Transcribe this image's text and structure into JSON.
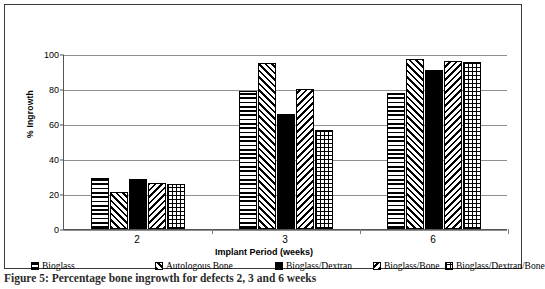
{
  "figure": {
    "caption": "Figure 5: Percentage bone ingrowth for defects 2, 3 and 6 weeks"
  },
  "chart_data": {
    "type": "bar",
    "title": "",
    "xlabel": "Implant Period (weeks)",
    "ylabel": "% Ingrowth",
    "categories": [
      "2",
      "3",
      "6"
    ],
    "ylim": [
      0,
      100
    ],
    "yticks": [
      0,
      20,
      40,
      60,
      80,
      100
    ],
    "grid": true,
    "legend_position": "bottom",
    "series": [
      {
        "name": "Bioglass",
        "pattern": "horizontal-lines",
        "values": [
          29,
          79,
          78
        ]
      },
      {
        "name": "Autologous Bone",
        "pattern": "back-diagonal",
        "values": [
          21,
          95,
          97
        ]
      },
      {
        "name": "Bioglass/Dextran",
        "pattern": "solid-black",
        "values": [
          28.5,
          66,
          91
        ]
      },
      {
        "name": "Bioglass/Bone",
        "pattern": "forward-diagonal",
        "values": [
          26.5,
          80,
          96
        ]
      },
      {
        "name": "Bioglass/Dextran/Bone",
        "pattern": "grid",
        "values": [
          26,
          56.5,
          95.5
        ]
      }
    ]
  }
}
